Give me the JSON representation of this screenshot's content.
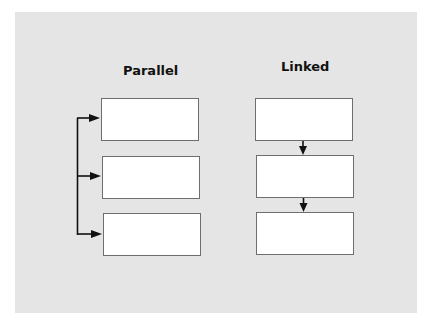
{
  "diagram": {
    "colors": {
      "background": "#e5e5e5",
      "box_fill": "#ffffff",
      "box_border": "#6e6e6e",
      "arrow": "#111111"
    },
    "columns": [
      {
        "title": "Parallel",
        "layout": "parallel",
        "boxes": [
          "",
          "",
          ""
        ],
        "connector": "single vertical trunk feeding an arrow into each box"
      },
      {
        "title": "Linked",
        "layout": "linked",
        "boxes": [
          "",
          "",
          ""
        ],
        "connector": "arrows chaining box 1 to box 2 to box 3"
      }
    ]
  }
}
